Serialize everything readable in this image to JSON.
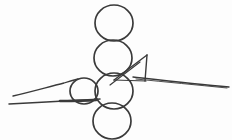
{
  "canvas": {
    "width": 232,
    "height": 140,
    "background_color": "#fdfdfd",
    "stroke_color": "#3a3a3a",
    "title": "hand-drawn line sketch"
  },
  "drawing": {
    "style": "monochrome freehand contour sketch",
    "subject": "four stacked circles with crossing lines and a triangular flag",
    "circles": [
      {
        "name": "circle-top",
        "cx": 114,
        "cy": 23,
        "rx": 19,
        "ry": 18,
        "stroke_width": 1.7
      },
      {
        "name": "circle-second",
        "cx": 113,
        "cy": 58,
        "rx": 19,
        "ry": 18,
        "stroke_width": 1.7
      },
      {
        "name": "circle-third",
        "cx": 114,
        "cy": 91,
        "rx": 19,
        "ry": 18,
        "stroke_width": 1.7
      },
      {
        "name": "circle-bottom",
        "cx": 112,
        "cy": 121,
        "rx": 19,
        "ry": 18,
        "stroke_width": 1.7
      },
      {
        "name": "circle-small-left",
        "cx": 84,
        "cy": 91,
        "rx": 14,
        "ry": 13,
        "stroke_width": 1.7
      }
    ],
    "strokes": [
      {
        "name": "left-upper-taper-line",
        "d": "M 13 96 C 30 92 48 87 64 83 C 70 81 74 80 78 79",
        "stroke_width": 1.3
      },
      {
        "name": "left-lower-taper-line",
        "d": "M 9 104 C 26 103 46 102 64 101 C 78 100 90 100 100 99",
        "stroke_width": 1.5
      },
      {
        "name": "left-lower-thick-accent",
        "d": "M 60 101 C 72 101 84 101 96 100",
        "stroke_width": 2.6
      },
      {
        "name": "triangle-flag-left-edge",
        "d": "M 147 55 L 114 80",
        "stroke_width": 1.4
      },
      {
        "name": "triangle-flag-right-edge",
        "d": "M 147 55 L 145 81",
        "stroke_width": 1.4
      },
      {
        "name": "triangle-flag-base",
        "d": "M 114 80 L 146 81",
        "stroke_width": 1.2
      },
      {
        "name": "diagonal-through-third-circle",
        "d": "M 140 62 L 110 85",
        "stroke_width": 1.2
      },
      {
        "name": "right-long-taper-line",
        "d": "M 133 77 C 160 80 195 84 229 87",
        "stroke_width": 1.4
      },
      {
        "name": "right-long-taper-line-under",
        "d": "M 136 79 C 165 82 198 85 227 88",
        "stroke_width": 0.9
      }
    ]
  }
}
